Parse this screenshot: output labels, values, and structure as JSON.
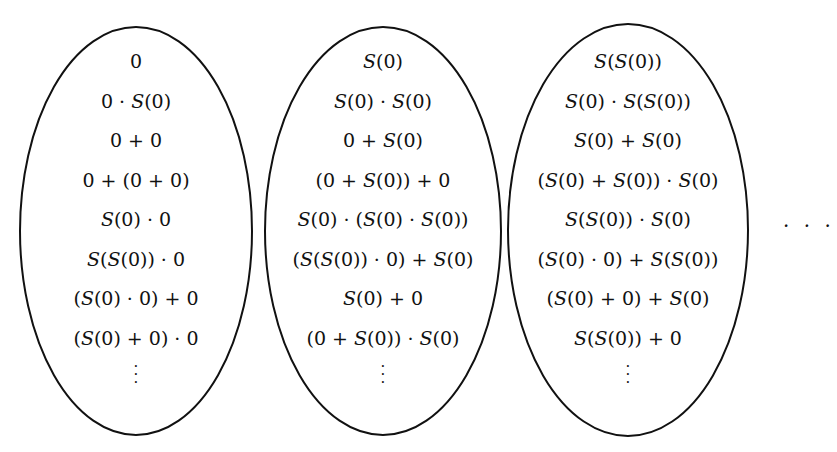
{
  "ellipses": [
    {
      "terms": [
        "0",
        "0 · S(0)",
        "0 + 0",
        "0 + (0 + 0)",
        "S(0) · 0",
        "S(S(0)) · 0",
        "(S(0) · 0) + 0",
        "(S(0) + 0) · 0"
      ],
      "continuation": "⋮"
    },
    {
      "terms": [
        "S(0)",
        "S(0) · S(0)",
        "0 + S(0)",
        "(0 + S(0)) + 0",
        "S(0) · (S(0) · S(0))",
        "(S(S(0)) · 0) + S(0)",
        "S(0) + 0",
        "(0 + S(0)) · S(0)"
      ],
      "continuation": "⋮"
    },
    {
      "terms": [
        "S(S(0))",
        "S(0) · S(S(0))",
        "S(0) + S(0)",
        "(S(0) + S(0)) · S(0)",
        "S(S(0)) · S(0)",
        "(S(0) · 0) + S(S(0))",
        "(S(0) + 0) + S(0)",
        "S(S(0)) + 0"
      ],
      "continuation": "⋮"
    }
  ],
  "trailing_ellipsis": "· · ·"
}
